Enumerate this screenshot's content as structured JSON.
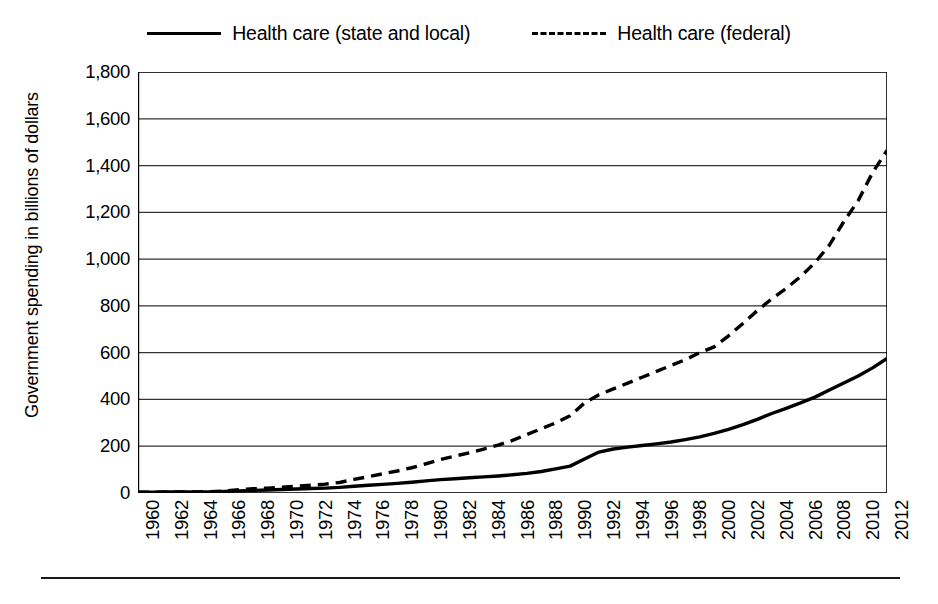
{
  "legend": {
    "position": "top",
    "entries": [
      {
        "label": "Health care (state and local)",
        "style": "solid",
        "swatch_icon": "solid-line-icon"
      },
      {
        "label": "Health care (federal)",
        "style": "dashed",
        "swatch_icon": "dashed-line-icon"
      }
    ]
  },
  "axes": {
    "y_title": "Government spending in billions of dollars",
    "y_ticks": [
      "0",
      "200",
      "400",
      "600",
      "800",
      "1,000",
      "1,200",
      "1,400",
      "1,600",
      "1,800"
    ],
    "x_ticks": [
      "1960",
      "1962",
      "1964",
      "1966",
      "1968",
      "1970",
      "1972",
      "1974",
      "1976",
      "1978",
      "1980",
      "1982",
      "1984",
      "1986",
      "1988",
      "1990",
      "1992",
      "1994",
      "1996",
      "1998",
      "2000",
      "2002",
      "2004",
      "2006",
      "2008",
      "2010",
      "2012"
    ]
  },
  "colors": {
    "line": "#000000",
    "grid": "#333333",
    "axis": "#000000",
    "background": "#ffffff"
  },
  "chart_data": {
    "type": "line",
    "title": "",
    "xlabel": "",
    "ylabel": "Government spending in billions of dollars",
    "ylim": [
      0,
      1800
    ],
    "xlim": [
      1960,
      2012
    ],
    "grid": true,
    "legend_position": "top",
    "y_tick_step": 200,
    "x_tick_step": 2,
    "x": [
      1960,
      1961,
      1962,
      1963,
      1964,
      1965,
      1966,
      1967,
      1968,
      1969,
      1970,
      1971,
      1972,
      1973,
      1974,
      1975,
      1976,
      1977,
      1978,
      1979,
      1980,
      1981,
      1982,
      1983,
      1984,
      1985,
      1986,
      1987,
      1988,
      1989,
      1990,
      1991,
      1992,
      1993,
      1994,
      1995,
      1996,
      1997,
      1998,
      1999,
      2000,
      2001,
      2002,
      2003,
      2004,
      2005,
      2006,
      2007,
      2008,
      2009,
      2010,
      2011,
      2012
    ],
    "series": [
      {
        "name": "Health care (state and local)",
        "style": "solid",
        "values": [
          3,
          3,
          4,
          4,
          5,
          5,
          7,
          9,
          11,
          13,
          15,
          17,
          19,
          21,
          24,
          29,
          33,
          37,
          41,
          46,
          52,
          57,
          61,
          65,
          69,
          73,
          78,
          84,
          92,
          103,
          115,
          145,
          175,
          188,
          196,
          203,
          210,
          218,
          228,
          240,
          255,
          272,
          292,
          315,
          340,
          362,
          385,
          410,
          440,
          470,
          500,
          535,
          575
        ]
      },
      {
        "name": "Health care (federal)",
        "style": "dashed",
        "values": [
          3,
          3,
          4,
          4,
          5,
          6,
          8,
          14,
          18,
          21,
          25,
          29,
          33,
          38,
          45,
          58,
          70,
          82,
          94,
          108,
          125,
          143,
          158,
          172,
          188,
          205,
          225,
          250,
          275,
          300,
          330,
          385,
          420,
          445,
          470,
          495,
          520,
          545,
          570,
          600,
          625,
          672,
          725,
          780,
          830,
          875,
          925,
          985,
          1060,
          1160,
          1250,
          1370,
          1465
        ]
      }
    ]
  }
}
